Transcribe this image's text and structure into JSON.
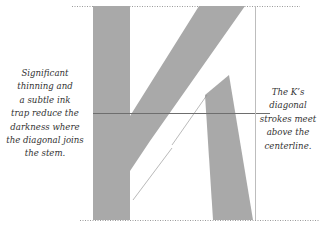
{
  "diagram": {
    "glyph_fill": "#a9a9a9",
    "guide_color": "#6e6e6e",
    "left_annotation": {
      "lines": [
        "Significant",
        "thinning and",
        "a subtle ink",
        "trap reduce the",
        "darkness where",
        "the diagonal joins",
        "the stem."
      ]
    },
    "right_annotation": {
      "lines": [
        "The K’s",
        "diagonal",
        "strokes meet",
        "above the",
        "centerline."
      ]
    },
    "guides": [
      "cap-height",
      "baseline",
      "centerline",
      "right-sidebearing"
    ]
  }
}
